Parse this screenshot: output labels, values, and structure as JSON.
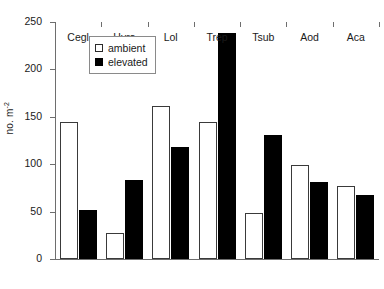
{
  "chart_data": {
    "type": "bar",
    "title": "",
    "xlabel": "",
    "ylabel": "no. m-2",
    "ylabel_base": "no. m",
    "ylabel_exponent": "-2",
    "categories": [
      "Cegl",
      "Hyra",
      "Lol",
      "Trep",
      "Tsub",
      "Aod",
      "Aca"
    ],
    "series": [
      {
        "name": "ambient",
        "color": "#ffffff",
        "edge_color": "#3a3a3a",
        "values": [
          145,
          27,
          161,
          145,
          49,
          99,
          77
        ]
      },
      {
        "name": "elevated",
        "color": "#000000",
        "edge_color": "#000000",
        "values": [
          52,
          83,
          118,
          238,
          131,
          81,
          68
        ]
      }
    ],
    "ylim": [
      0,
      250
    ],
    "yticks": [
      0,
      50,
      100,
      150,
      200,
      250
    ],
    "ytick_labels": [
      "0",
      "50",
      "100",
      "150",
      "200",
      "250"
    ],
    "grid": false,
    "legend_position": "upper-left-inside"
  },
  "legend": {
    "entries": [
      {
        "label": "ambient",
        "swatch": "open-square"
      },
      {
        "label": "elevated",
        "swatch": "filled-square"
      }
    ]
  }
}
